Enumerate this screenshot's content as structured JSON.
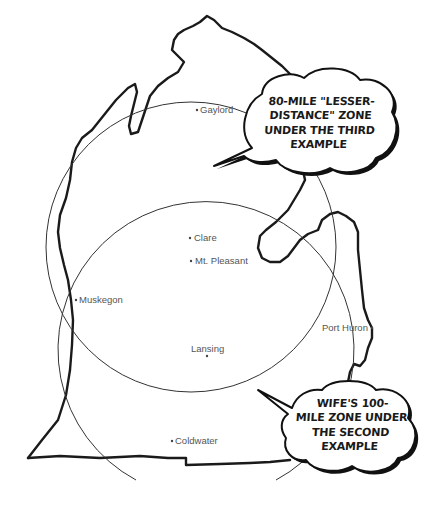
{
  "map": {
    "region": "Michigan Lower Peninsula",
    "colors": {
      "outline": "#1a1a1a",
      "zone_circle": "#333333",
      "label_text": "#555555",
      "background": "#ffffff"
    }
  },
  "cities": [
    {
      "name": "Gaylord",
      "x": 197,
      "y": 110
    },
    {
      "name": "Clare",
      "x": 190,
      "y": 238
    },
    {
      "name": "Mt. Pleasant",
      "x": 191,
      "y": 261
    },
    {
      "name": "Muskegon",
      "x": 76,
      "y": 300
    },
    {
      "name": "Port Huron",
      "x": 372,
      "y": 328
    },
    {
      "name": "Lansing",
      "x": 207,
      "y": 356
    },
    {
      "name": "Coldwater",
      "x": 172,
      "y": 441
    }
  ],
  "zones": [
    {
      "name": "80-mile lesser-distance zone",
      "cx": 191,
      "cy": 247,
      "r": 145
    },
    {
      "name": "wife's 100-mile zone",
      "cx": 203,
      "cy": 358,
      "r": 148
    }
  ],
  "callouts": [
    {
      "id": "lesser-distance",
      "lines": [
        "80-MILE \"LESSER-",
        "DISTANCE\" ZONE",
        "UNDER THE THIRD",
        "EXAMPLE"
      ]
    },
    {
      "id": "wife-zone",
      "lines": [
        "WIFE'S 100-",
        "MILE ZONE UNDER",
        "THE SECOND",
        "EXAMPLE"
      ]
    }
  ]
}
